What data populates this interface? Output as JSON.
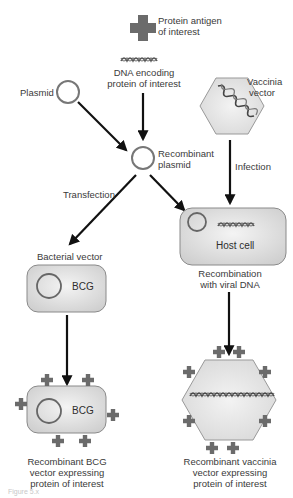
{
  "labels": {
    "protein_antigen": "Protein antigen\nof interest",
    "protein_antigen_l1": "Protein antigen",
    "protein_antigen_l2": "of interest",
    "dna_l1": "DNA encoding",
    "dna_l2": "protein of interest",
    "plasmid": "Plasmid",
    "vaccinia_l1": "Vaccinia",
    "vaccinia_l2": "vector",
    "recomb_plasmid_l1": "Recombinant",
    "recomb_plasmid_l2": "plasmid",
    "transfection": "Transfection",
    "infection": "Infection",
    "host_cell": "Host cell",
    "recombination_l1": "Recombination",
    "recombination_l2": "with viral DNA",
    "bacterial_vector": "Bacterial vector",
    "bcg": "BCG",
    "bcg2": "BCG",
    "recomb_bcg_l1": "Recombinant BCG",
    "recomb_bcg_l2": "vector expressing",
    "recomb_bcg_l3": "protein of interest",
    "recomb_vac_l1": "Recombinant vaccinia",
    "recomb_vac_l2": "vector expressing",
    "recomb_vac_l3": "protein of interest",
    "caption": "Figure 5.x"
  },
  "colors": {
    "antigen": "#6b6b6b",
    "box_fill": "#e4e4e4",
    "box_stroke": "#8a8a8a",
    "arrow": "#111111",
    "dna": "#555555"
  }
}
